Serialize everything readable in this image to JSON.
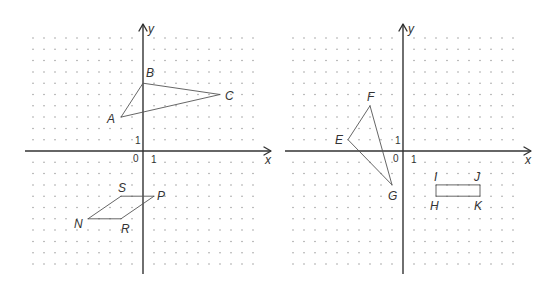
{
  "grid": {
    "unit_x": 11,
    "unit_y": 11.3,
    "range": [
      -10,
      10
    ],
    "dot_color": "#9a9a9a"
  },
  "panels": [
    {
      "id": "left",
      "origin_px": [
        143,
        151
      ],
      "axis_labels": {
        "x": "x",
        "y": "y"
      },
      "tick_labels": {
        "origin": "0",
        "x_one": "1",
        "y_one": "1"
      },
      "shapes": [
        {
          "name": "triangle-ABC",
          "closed": true,
          "points": [
            {
              "label": "A",
              "x": -2,
              "y": 3,
              "label_dx": -14,
              "label_dy": 6
            },
            {
              "label": "B",
              "x": 0,
              "y": 6,
              "label_dx": 3,
              "label_dy": -6
            },
            {
              "label": "C",
              "x": 7,
              "y": 5,
              "label_dx": 5,
              "label_dy": 5
            }
          ]
        },
        {
          "name": "parallelogram-NRPS",
          "closed": true,
          "points": [
            {
              "label": "N",
              "x": -5,
              "y": -6,
              "label_dx": -14,
              "label_dy": 9
            },
            {
              "label": "R",
              "x": -2,
              "y": -6,
              "label_dx": 0,
              "label_dy": 14
            },
            {
              "label": "P",
              "x": 1,
              "y": -4,
              "label_dx": 3,
              "label_dy": 4
            },
            {
              "label": "S",
              "x": -2,
              "y": -4,
              "label_dx": -3,
              "label_dy": -4
            }
          ]
        }
      ]
    },
    {
      "id": "right",
      "origin_px": [
        403,
        151
      ],
      "axis_labels": {
        "x": "x",
        "y": "y"
      },
      "tick_labels": {
        "origin": "0",
        "x_one": "1",
        "y_one": "1"
      },
      "shapes": [
        {
          "name": "triangle-EFG",
          "closed": true,
          "points": [
            {
              "label": "E",
              "x": -5,
              "y": 1,
              "label_dx": -13,
              "label_dy": 4
            },
            {
              "label": "F",
              "x": -3,
              "y": 4,
              "label_dx": -3,
              "label_dy": -5
            },
            {
              "label": "G",
              "x": -1,
              "y": -3,
              "label_dx": -4,
              "label_dy": 15
            }
          ]
        },
        {
          "name": "rectangle-IJKH",
          "closed": true,
          "points": [
            {
              "label": "I",
              "x": 3,
              "y": -3,
              "label_dx": -2,
              "label_dy": -4
            },
            {
              "label": "J",
              "x": 7,
              "y": -3,
              "label_dx": -6,
              "label_dy": -4
            },
            {
              "label": "K",
              "x": 7,
              "y": -4,
              "label_dx": -6,
              "label_dy": 14
            },
            {
              "label": "H",
              "x": 3,
              "y": -4,
              "label_dx": -6,
              "label_dy": 14
            }
          ]
        }
      ]
    }
  ]
}
